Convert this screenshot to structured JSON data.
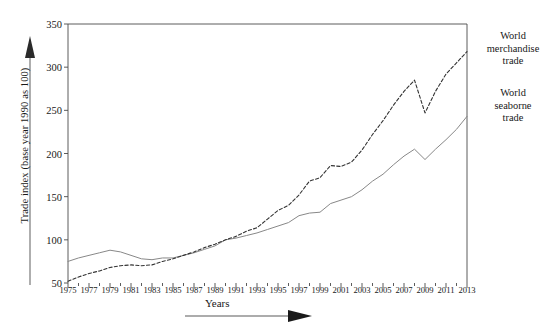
{
  "chart_data": {
    "type": "line",
    "title": "",
    "xlabel": "Years",
    "ylabel": "Trade index (base year 1990 as 100)",
    "xlim": [
      1975,
      2013
    ],
    "ylim": [
      50,
      350
    ],
    "yticks": [
      50,
      100,
      150,
      200,
      250,
      300,
      350
    ],
    "xticks": [
      1975,
      1977,
      1979,
      1981,
      1983,
      1985,
      1987,
      1989,
      1991,
      1993,
      1995,
      1997,
      1999,
      2001,
      2003,
      2005,
      2007,
      2009,
      2011,
      2013
    ],
    "minor_xtick_step": 1,
    "grid": false,
    "legend_position": "right-inline",
    "x": [
      1975,
      1976,
      1977,
      1978,
      1979,
      1980,
      1981,
      1982,
      1983,
      1984,
      1985,
      1986,
      1987,
      1988,
      1989,
      1990,
      1991,
      1992,
      1993,
      1994,
      1995,
      1996,
      1997,
      1998,
      1999,
      2000,
      2001,
      2002,
      2003,
      2004,
      2005,
      2006,
      2007,
      2008,
      2009,
      2010,
      2011,
      2012,
      2013
    ],
    "series": [
      {
        "name": "World merchandise trade",
        "style": "dashed",
        "color": "#333333",
        "label_lines": [
          "World",
          "merchandise",
          "trade"
        ],
        "values": [
          52,
          57,
          61,
          64,
          68,
          70,
          71,
          70,
          71,
          75,
          78,
          82,
          86,
          91,
          95,
          100,
          104,
          110,
          114,
          124,
          134,
          140,
          152,
          168,
          172,
          186,
          185,
          190,
          204,
          222,
          238,
          256,
          272,
          285,
          247,
          272,
          292,
          305,
          318
        ]
      },
      {
        "name": "World seaborne trade",
        "style": "solid",
        "color": "#888888",
        "label_lines": [
          "World",
          "seaborne",
          "trade"
        ],
        "values": [
          75,
          79,
          82,
          85,
          88,
          86,
          82,
          78,
          77,
          79,
          79,
          82,
          85,
          89,
          93,
          100,
          102,
          105,
          108,
          112,
          116,
          120,
          128,
          131,
          132,
          142,
          146,
          150,
          158,
          168,
          176,
          187,
          197,
          205,
          193,
          205,
          216,
          228,
          243
        ]
      }
    ]
  },
  "annotations": {
    "x_axis_arrow": "arrow-right",
    "y_axis_arrow": "arrow-up"
  }
}
